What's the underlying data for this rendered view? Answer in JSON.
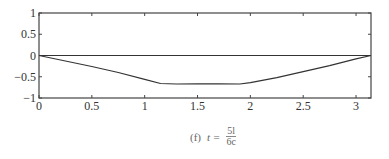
{
  "chart_data": {
    "type": "line",
    "title": "",
    "xlabel": "",
    "ylabel": "",
    "xlim": [
      0,
      3.1416
    ],
    "ylim": [
      -1,
      1
    ],
    "xticks": [
      0,
      0.5,
      1,
      1.5,
      2,
      2.5,
      3
    ],
    "xtick_labels": [
      "0",
      "0.5",
      "1",
      "1.5",
      "2",
      "2.5",
      "3"
    ],
    "yticks": [
      1,
      0.5,
      0,
      -0.5,
      -1
    ],
    "ytick_labels": [
      "1",
      "0.5",
      "0",
      "-0.5",
      "-1"
    ],
    "grid": false,
    "series": [
      {
        "name": "zero-line",
        "x": [
          0,
          3.1416
        ],
        "y": [
          0,
          0
        ]
      },
      {
        "name": "curve",
        "x": [
          0,
          0.25,
          0.5,
          0.75,
          1.0,
          1.15,
          1.3,
          1.5,
          1.7,
          1.9,
          2.0,
          2.25,
          2.5,
          2.75,
          3.0,
          3.1416
        ],
        "y": [
          0,
          -0.13,
          -0.26,
          -0.4,
          -0.56,
          -0.66,
          -0.67,
          -0.665,
          -0.665,
          -0.67,
          -0.64,
          -0.52,
          -0.38,
          -0.24,
          -0.08,
          0
        ]
      }
    ],
    "caption": {
      "label": "(f)",
      "lhs": "t =",
      "numerator": "5l",
      "denominator": "6c"
    }
  }
}
